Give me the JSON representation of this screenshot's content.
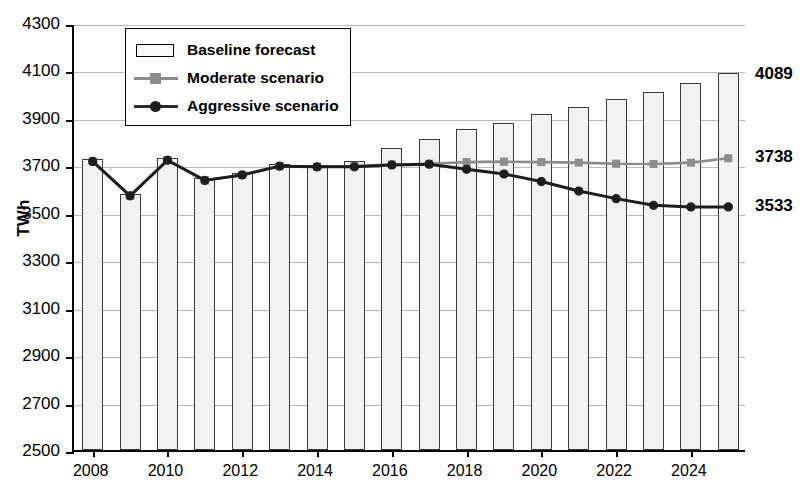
{
  "chart_data": {
    "type": "bar",
    "title": "",
    "xlabel": "",
    "ylabel": "TWh",
    "ylim": [
      2500,
      4300
    ],
    "ystep": 200,
    "grid": true,
    "legend_position": "top-left",
    "categories": [
      "2008",
      "2009",
      "2010",
      "2011",
      "2012",
      "2013",
      "2014",
      "2015",
      "2016",
      "2017",
      "2018",
      "2019",
      "2020",
      "2021",
      "2022",
      "2023",
      "2024",
      "2025"
    ],
    "x_tick_labels": [
      "2008",
      "2010",
      "2012",
      "2014",
      "2016",
      "2018",
      "2020",
      "2022",
      "2024"
    ],
    "y_tick_labels": [
      "2500",
      "2700",
      "2900",
      "3100",
      "3300",
      "3500",
      "3700",
      "3900",
      "4100",
      "4300"
    ],
    "series": [
      {
        "name": "Baseline forecast",
        "type": "bar",
        "values": [
          3725,
          3580,
          3730,
          3645,
          3668,
          3705,
          3702,
          3718,
          3775,
          3810,
          3852,
          3880,
          3915,
          3948,
          3978,
          4010,
          4048,
          4089
        ]
      },
      {
        "name": "Moderate scenario",
        "type": "line",
        "values": [
          3725,
          3580,
          3730,
          3645,
          3668,
          3705,
          3702,
          3705,
          3712,
          3715,
          3722,
          3724,
          3722,
          3720,
          3715,
          3714,
          3720,
          3738
        ]
      },
      {
        "name": "Aggressive scenario",
        "type": "line",
        "values": [
          3725,
          3580,
          3730,
          3645,
          3668,
          3705,
          3702,
          3702,
          3710,
          3713,
          3692,
          3672,
          3640,
          3600,
          3568,
          3540,
          3533,
          3533
        ]
      }
    ],
    "annotations": [
      {
        "label": "4089",
        "series": "Baseline forecast",
        "x": "2025",
        "value": 4089
      },
      {
        "label": "3738",
        "series": "Moderate scenario",
        "x": "2025",
        "value": 3738
      },
      {
        "label": "3533",
        "series": "Aggressive scenario",
        "x": "2025",
        "value": 3533
      }
    ],
    "colors": {
      "bar_fill": "#f2f2f2",
      "bar_edge": "#3a3a3a",
      "moderate": "#8c8c8c",
      "aggressive": "#1d1d1d",
      "grid": "#b9b9b9",
      "axis": "#000000"
    }
  },
  "legend": {
    "items": [
      {
        "label": "Baseline forecast"
      },
      {
        "label": "Moderate scenario"
      },
      {
        "label": "Aggressive scenario"
      }
    ]
  }
}
